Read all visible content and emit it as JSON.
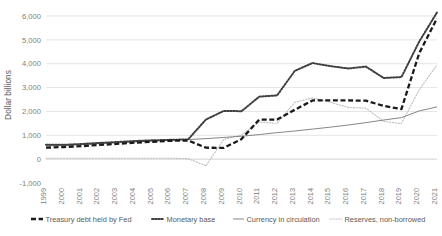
{
  "chart_data": {
    "type": "line",
    "title": "",
    "xlabel": "",
    "ylabel": "Dollar billions",
    "ylim": [
      -1000,
      6000
    ],
    "yticks": [
      -1000,
      0,
      1000,
      2000,
      3000,
      4000,
      5000,
      6000
    ],
    "ytick_labels": [
      "-1,000",
      "0",
      "1,000",
      "2,000",
      "3,000",
      "4,000",
      "5,000",
      "6,000"
    ],
    "grid": true,
    "legend_position": "bottom",
    "x": [
      1999,
      2000,
      2001,
      2002,
      2003,
      2004,
      2005,
      2006,
      2007,
      2008,
      2009,
      2010,
      2011,
      2012,
      2013,
      2014,
      2015,
      2016,
      2017,
      2018,
      2019,
      2020,
      2021
    ],
    "xtick_labels": [
      "1999",
      "2000",
      "2001",
      "2002",
      "2003",
      "2004",
      "2005",
      "2006",
      "2007",
      "2008",
      "2009",
      "2010",
      "2011",
      "2012",
      "2013",
      "2014",
      "2015",
      "2016",
      "2017",
      "2018",
      "2019",
      "2020",
      "2021"
    ],
    "series": [
      {
        "name": "Treasury debt held by Fed",
        "style": "bold-dashed",
        "color": "#1a1a1a",
        "values": [
          480,
          510,
          545,
          595,
          640,
          690,
          730,
          770,
          780,
          480,
          470,
          840,
          1660,
          1660,
          2070,
          2460,
          2460,
          2460,
          2450,
          2230,
          2100,
          4440,
          5900
        ]
      },
      {
        "name": "Monetary base",
        "style": "bold-dotted",
        "color": "#404040",
        "values": [
          600,
          600,
          635,
          680,
          720,
          760,
          790,
          810,
          830,
          1660,
          2020,
          2010,
          2620,
          2670,
          3700,
          4030,
          3900,
          3800,
          3880,
          3400,
          3440,
          4930,
          6150
        ]
      },
      {
        "name": "Currency in circulation",
        "style": "thin-solid",
        "color": "#808080",
        "values": [
          560,
          580,
          610,
          650,
          690,
          720,
          760,
          790,
          820,
          860,
          910,
          960,
          1030,
          1110,
          1180,
          1260,
          1340,
          1430,
          1530,
          1640,
          1740,
          2020,
          2190
        ]
      },
      {
        "name": "Reserves, non-borrowed",
        "style": "fine-dotted",
        "color": "#bfbfbf",
        "values": [
          40,
          40,
          40,
          40,
          40,
          40,
          40,
          40,
          20,
          -280,
          830,
          1010,
          1560,
          1500,
          2380,
          2570,
          2380,
          2170,
          2140,
          1580,
          1490,
          2910,
          3950
        ]
      }
    ]
  },
  "legend": {
    "items": [
      {
        "label": "Treasury debt held by Fed"
      },
      {
        "label": "Monetary base"
      },
      {
        "label": "Currency in circulation"
      },
      {
        "label": "Reserves, non-borrowed"
      }
    ]
  }
}
